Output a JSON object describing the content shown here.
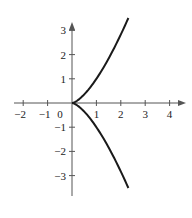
{
  "chart_data": {
    "type": "line",
    "title": "",
    "xlabel": "",
    "ylabel": "",
    "xlim": [
      -2.4,
      4.7
    ],
    "ylim": [
      -3.7,
      3.3
    ],
    "grid": false,
    "legend": null,
    "x_ticks": [
      -2,
      -1,
      0,
      1,
      2,
      3,
      4
    ],
    "x_tick_labels": [
      "−2",
      "−1",
      "0",
      "1",
      "2",
      "3",
      "4"
    ],
    "y_ticks": [
      -3,
      -2,
      -1,
      1,
      2,
      3
    ],
    "y_tick_labels": [
      "−3",
      "−2",
      "−1",
      "1",
      "2",
      "3"
    ],
    "origin_label": "0",
    "curve": {
      "description": "semicubical parabola (cusp at origin), y^2 = x^3",
      "parametric": {
        "x": "t^2",
        "y": "t^3",
        "t_range": [
          -1.52,
          1.52
        ]
      },
      "upper_branch": [
        [
          0,
          0
        ],
        [
          0.25,
          0.125
        ],
        [
          0.5,
          0.354
        ],
        [
          1,
          1
        ],
        [
          1.5,
          1.837
        ],
        [
          2,
          2.828
        ],
        [
          2.3,
          3.49
        ]
      ],
      "lower_branch": [
        [
          0,
          0
        ],
        [
          0.25,
          -0.125
        ],
        [
          0.5,
          -0.354
        ],
        [
          1,
          -1
        ],
        [
          1.5,
          -1.837
        ],
        [
          2,
          -2.828
        ],
        [
          2.3,
          -3.49
        ]
      ]
    },
    "colors": {
      "axis": "#555555",
      "curve": "#1a1a1a",
      "text": "#222222"
    }
  }
}
